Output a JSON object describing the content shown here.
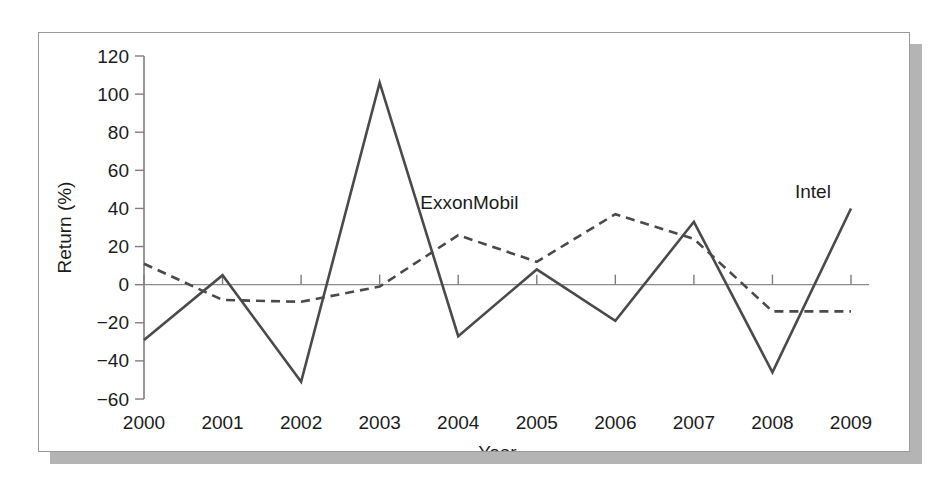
{
  "chart_data": {
    "type": "line",
    "title": "",
    "xlabel": "Year",
    "ylabel": "Return (%)",
    "x": [
      2000,
      2001,
      2002,
      2003,
      2004,
      2005,
      2006,
      2007,
      2008,
      2009
    ],
    "categories": [
      "2000",
      "2001",
      "2002",
      "2003",
      "2004",
      "2005",
      "2006",
      "2007",
      "2008",
      "2009"
    ],
    "xtick_labels": [
      "2000",
      "2001",
      "2002",
      "2003",
      "2004",
      "2005",
      "2006",
      "2007",
      "2008",
      "2009"
    ],
    "ytick_labels": [
      "120",
      "100",
      "80",
      "60",
      "40",
      "20",
      "0",
      "-20",
      "-40",
      "-60"
    ],
    "yticks": [
      120,
      100,
      80,
      60,
      40,
      20,
      0,
      -20,
      -40,
      -60
    ],
    "ylim": [
      -60,
      120
    ],
    "xlim": [
      2000,
      2009
    ],
    "grid": false,
    "legend": "inline-labels",
    "zero_line": true,
    "series": [
      {
        "name": "Intel",
        "style": "solid",
        "color": "#4a4a4a",
        "label_position": "upper-right",
        "values": [
          -29,
          5,
          -51,
          106,
          -27,
          8,
          -19,
          33,
          -46,
          40
        ]
      },
      {
        "name": "ExxonMobil",
        "style": "dashed",
        "color": "#4a4a4a",
        "label_position": "upper-middle",
        "values": [
          11,
          -8,
          -9,
          -1,
          26,
          12,
          37,
          24,
          -14,
          -14
        ]
      }
    ]
  },
  "colors": {
    "line": "#4a4a4a",
    "axis": "#7d7d7d",
    "text": "#1b1b1b",
    "card_background": "#ffffff",
    "card_border": "#9a9a9a",
    "shadow": "#b4b4b4",
    "page_background": "#ffffff"
  }
}
